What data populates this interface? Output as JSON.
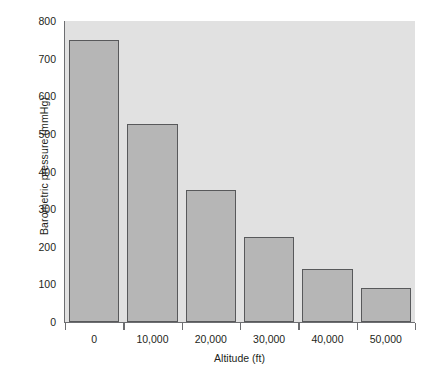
{
  "figure": {
    "background_color": "#ffffff",
    "plot_background_color": "#e1e1e1",
    "bar_fill_color": "#b6b6b6",
    "bar_border_color": "#58595b",
    "axis_color": "#6d6e71",
    "text_color": "#231f20",
    "top_crop_artifact": ""
  },
  "chart_data": {
    "type": "bar",
    "title": "",
    "xlabel": "Altitude (ft)",
    "ylabel": "Barometric pressure (mmHg)",
    "categories": [
      "0",
      "10,000",
      "20,000",
      "30,000",
      "40,000",
      "50,000"
    ],
    "values": [
      750,
      525,
      350,
      226,
      141,
      91
    ],
    "ylim": [
      0,
      800
    ],
    "yticks": [
      0,
      100,
      200,
      300,
      400,
      500,
      600,
      700,
      800
    ],
    "ytick_labels": [
      "0",
      "100",
      "200",
      "300",
      "400",
      "500",
      "600",
      "700",
      "800"
    ],
    "xtick_labels": [
      "0",
      "10,000",
      "20,000",
      "30,000",
      "40,000",
      "50,000"
    ],
    "grid": false,
    "legend": null,
    "orientation": "vertical",
    "series": [
      {
        "name": "Barometric pressure",
        "values": [
          750,
          525,
          350,
          226,
          141,
          91
        ]
      }
    ]
  }
}
